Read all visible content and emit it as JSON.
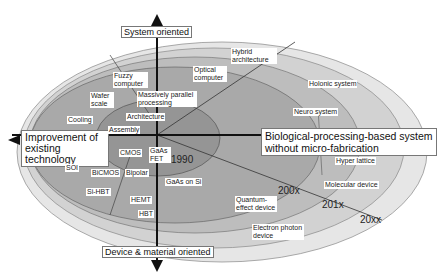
{
  "diagram": {
    "axes": {
      "top": "System oriented",
      "bottom": "Device & material oriented",
      "left_line1": "Improvement of",
      "left_line2": "existing technology",
      "right_line1": "Biological-processing-based system",
      "right_line2": "without micro-fabrication"
    },
    "eras": {
      "e1990": "1990",
      "e200x": "200x",
      "e201x": "201x",
      "e20xx": "20xx"
    },
    "labels": {
      "hybrid_architecture": "Hybrid architecture",
      "optical_computer": "Optical computer",
      "fuzzy_computer": "Fuzzy computer",
      "wafer_scale": "Wafer scale",
      "massively_parallel": "Massively parallel processing",
      "architecture": "Architecture",
      "cooling": "Cooling",
      "assembly": "Assembly",
      "holonic_system": "Holonic system",
      "neuro_system": "Neuro system",
      "cmos": "CMOS",
      "gaas_fet": "GaAs FET",
      "soi": "SOI",
      "bicmos": "BiCMOS",
      "bipolar": "Bipolar",
      "gaas_on_si": "GaAs on Si",
      "si_hbt": "Si-HBT",
      "hemt": "HEMT",
      "hbt": "HBT",
      "hyper_lattice": "Hyper lattice",
      "molecular_device": "Molecular device",
      "quantum_effect_device": "Quantum-effect device",
      "electron_photon_device": "Electron photon device"
    },
    "colors": {
      "ring_outer": "#e6e6e6",
      "ring_2": "#d2d2d2",
      "ring_3": "#bdbdbd",
      "ring_4": "#a9a9a9",
      "core": "#959595",
      "axis": "#111111"
    }
  }
}
